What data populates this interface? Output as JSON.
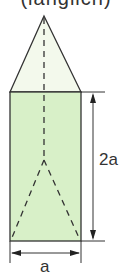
{
  "caption": "(länglich)",
  "figure": {
    "fill_color": "#d8f0c8",
    "triangle_fill": "#f3f9ec",
    "stroke_color": "#333333",
    "height_label": "2a",
    "width_label": "a"
  }
}
